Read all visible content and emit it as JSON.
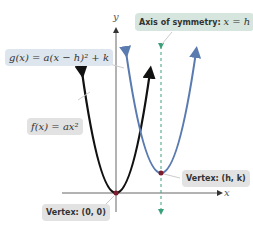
{
  "diagram": {
    "axes": {
      "x_label": "x",
      "y_label": "y"
    },
    "labels": {
      "g_eq": "g(x) = a(x − h)² + k",
      "f_eq": "f(x) = ax²",
      "axis_sym_prefix": "Axis of symmetry: ",
      "axis_sym_eq": "x = h",
      "vertex_hk": "Vertex: (h, k)",
      "vertex_origin": "Vertex: (0, 0)"
    },
    "colors": {
      "f_curve": "#111111",
      "g_curve": "#5a7bb0",
      "axis_of_symmetry": "#3aa07a",
      "vertex_dot": "#7a1e2e",
      "label_bg_blue": "#dde6ee",
      "label_bg_gray": "#e2e2e2",
      "label_bg_green": "#d6e6de"
    }
  }
}
